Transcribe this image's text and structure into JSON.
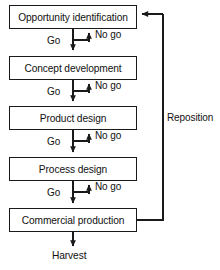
{
  "diagram": {
    "line_color": "#1a1a1a",
    "text_color": "#111111",
    "background": "#ffffff",
    "stages": [
      {
        "id": "opportunity-identification",
        "label": "Opportunity identification",
        "x": 9,
        "y": 5,
        "w": 128,
        "h": 24
      },
      {
        "id": "concept-development",
        "label": "Concept development",
        "x": 9,
        "y": 56,
        "w": 128,
        "h": 24
      },
      {
        "id": "product-design",
        "label": "Product design",
        "x": 9,
        "y": 106,
        "w": 128,
        "h": 24
      },
      {
        "id": "process-design",
        "label": "Process design",
        "x": 9,
        "y": 157,
        "w": 128,
        "h": 24
      },
      {
        "id": "commercial-production",
        "label": "Commercial production",
        "x": 9,
        "y": 208,
        "w": 128,
        "h": 24
      }
    ],
    "decision_labels": {
      "go": "Go",
      "no_go": "No go"
    },
    "go_labels": [
      {
        "id": "go-1",
        "text": "Go",
        "x": 47,
        "y": 41
      },
      {
        "id": "go-2",
        "text": "Go",
        "x": 47,
        "y": 92
      },
      {
        "id": "go-3",
        "text": "Go",
        "x": 47,
        "y": 142
      },
      {
        "id": "go-4",
        "text": "Go",
        "x": 47,
        "y": 193
      }
    ],
    "nogo_labels": [
      {
        "id": "nogo-1",
        "text": "No go",
        "x": 95,
        "y": 29
      },
      {
        "id": "nogo-2",
        "text": "No go",
        "x": 95,
        "y": 80
      },
      {
        "id": "nogo-3",
        "text": "No go",
        "x": 95,
        "y": 130
      },
      {
        "id": "nogo-4",
        "text": "No go",
        "x": 95,
        "y": 181
      }
    ],
    "feedback_loop": {
      "id": "reposition",
      "label": "Reposition",
      "label_x": 167,
      "label_y": 112,
      "from_stage": "commercial-production",
      "to_stage": "opportunity-identification"
    },
    "terminal": {
      "id": "harvest",
      "label": "Harvest",
      "x": 73,
      "y": 255
    }
  }
}
